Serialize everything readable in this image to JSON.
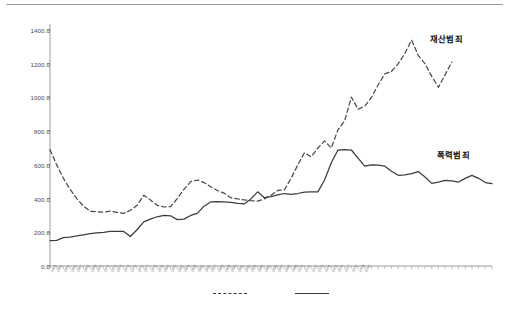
{
  "chart_data": {
    "type": "line",
    "title": "",
    "xlabel": "",
    "ylabel": "",
    "ylim": [
      0,
      1400
    ],
    "ytick_interval": 200,
    "ytick_labels": [
      "0.0",
      "200.0",
      "400.0",
      "600.0",
      "800.0",
      "1000.0",
      "1200.0",
      "1400.0"
    ],
    "ytick_values": [
      0,
      200,
      400,
      600,
      800,
      1000,
      1200,
      1400
    ],
    "grid": false,
    "legend_position": "bottom",
    "annotations": [
      {
        "text": "재산범죄",
        "series": "재산범죄",
        "x": 430,
        "y": 32
      },
      {
        "text": "폭력범죄",
        "series": "폭력범죄",
        "x": 437,
        "y": 148
      }
    ],
    "categories": [
      "1963",
      "1964",
      "1965",
      "1966",
      "1967",
      "1968",
      "1969",
      "1970",
      "1971",
      "1972",
      "1973",
      "1974",
      "1975",
      "1976",
      "1977",
      "1978",
      "1979",
      "1980",
      "1981",
      "1982",
      "1983",
      "1984",
      "1985",
      "1986",
      "1987",
      "1988",
      "1989",
      "1990",
      "1991",
      "1992",
      "1993",
      "1994",
      "1995",
      "1996",
      "1997",
      "1998",
      "1999",
      "2000",
      "2001",
      "2002",
      "2003",
      "2004",
      "2005",
      "2006",
      "2007",
      "2008",
      "2009",
      "2010"
    ],
    "series": [
      {
        "name": "재산범죄",
        "style": "dashed",
        "color": "#4a4a4a",
        "values": [
          690,
          600,
          520,
          455,
          400,
          355,
          325,
          322,
          320,
          325,
          318,
          312,
          330,
          360,
          420,
          392,
          360,
          350,
          352,
          400,
          455,
          500,
          510,
          495,
          470,
          448,
          432,
          405,
          398,
          392,
          388,
          385,
          398,
          420,
          448,
          452,
          520,
          600,
          672,
          648,
          700,
          742,
          700,
          808,
          862,
          1002,
          930,
          948
        ]
      },
      {
        "name": "폭력범죄",
        "style": "solid",
        "color": "#3c3c3c",
        "values": [
          150,
          152,
          168,
          172,
          178,
          185,
          192,
          196,
          200,
          205,
          206,
          205,
          175,
          215,
          262,
          278,
          292,
          300,
          298,
          275,
          278,
          300,
          312,
          355,
          380,
          382,
          380,
          378,
          372,
          368,
          398,
          440,
          405,
          412,
          422,
          430,
          425,
          430,
          438,
          440,
          440,
          510,
          612,
          688,
          690,
          688,
          640,
          592
        ]
      }
    ],
    "series_extended": {
      "재산범죄_tail": [
        1000,
        1075,
        1140,
        1155,
        1200,
        1262,
        1340,
        1248,
        1200,
        1125,
        1060,
        1135,
        1210
      ],
      "폭력범죄_tail": [
        600,
        598,
        592,
        562,
        538,
        540,
        548,
        560,
        528,
        490,
        498,
        508,
        505,
        498,
        520,
        538,
        520,
        495,
        488
      ]
    }
  },
  "legend": {
    "items": [
      {
        "name": "legend-dashed",
        "style": "dashed",
        "label": ""
      },
      {
        "name": "legend-solid",
        "style": "solid",
        "label": ""
      }
    ]
  }
}
